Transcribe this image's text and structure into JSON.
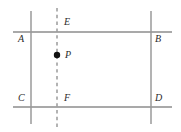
{
  "figure": {
    "type": "geometry-diagram",
    "width": 181,
    "height": 132,
    "background_color": "#ffffff",
    "stroke_color": "#8c8c8c",
    "dash_color": "#9a9a9a",
    "point_color": "#111111",
    "label_color": "#2b2b2b"
  },
  "lines": {
    "horizontal": [
      {
        "name": "line-AB",
        "y": 32,
        "x1": 13,
        "x2": 172,
        "style": "solid"
      },
      {
        "name": "line-CD",
        "y": 107,
        "x1": 13,
        "x2": 172,
        "style": "solid"
      }
    ],
    "vertical": [
      {
        "name": "line-AC",
        "x": 31,
        "y1": 11,
        "y2": 124,
        "style": "solid"
      },
      {
        "name": "line-BD",
        "x": 151,
        "y1": 11,
        "y2": 124,
        "style": "solid"
      }
    ],
    "dashed": [
      {
        "name": "line-EF",
        "x": 57,
        "y1": 8,
        "y2": 128,
        "style": "dashed"
      }
    ]
  },
  "points": [
    {
      "name": "point-P",
      "label": "P",
      "x": 57,
      "y": 55,
      "radius": 3.2,
      "filled": true
    }
  ],
  "labels": [
    {
      "name": "label-A",
      "text": "A",
      "x": 18,
      "y": 34
    },
    {
      "name": "label-B",
      "text": "B",
      "x": 155,
      "y": 34
    },
    {
      "name": "label-C",
      "text": "C",
      "x": 18,
      "y": 93
    },
    {
      "name": "label-D",
      "text": "D",
      "x": 155,
      "y": 93
    },
    {
      "name": "label-E",
      "text": "E",
      "x": 64,
      "y": 17
    },
    {
      "name": "label-F",
      "text": "F",
      "x": 64,
      "y": 93
    },
    {
      "name": "label-P",
      "text": "P",
      "x": 65,
      "y": 50
    }
  ]
}
